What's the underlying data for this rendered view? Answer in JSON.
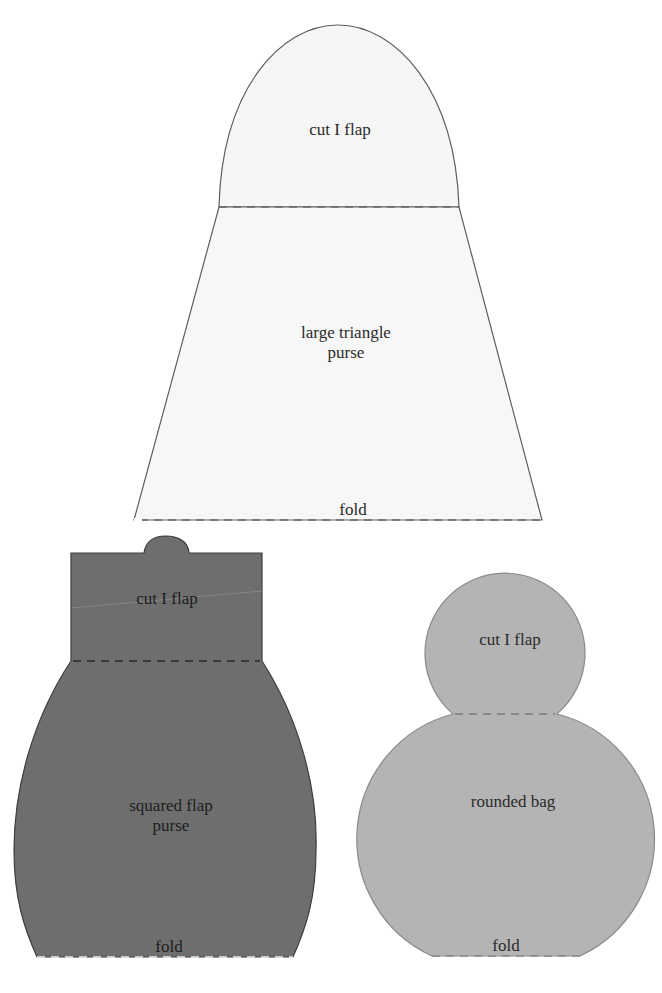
{
  "patterns": [
    {
      "name": "large triangle purse",
      "fill": "#f6f6f6",
      "flap_label": "cut I flap",
      "body_label": "large triangle\npurse",
      "fold_label": "fold"
    },
    {
      "name": "squared flap purse",
      "fill": "#6e6e6e",
      "flap_label": "cut I flap",
      "body_label": "squared flap\npurse",
      "fold_label": "fold"
    },
    {
      "name": "rounded bag",
      "fill": "#b4b4b4",
      "flap_label": "cut I flap",
      "body_label": "rounded bag",
      "fold_label": "fold"
    }
  ]
}
